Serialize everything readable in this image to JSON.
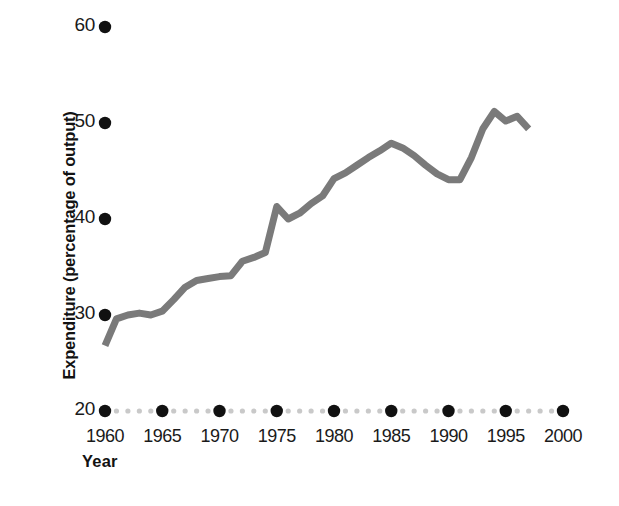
{
  "chart_data": {
    "type": "line",
    "title": "",
    "xlabel": "Year",
    "ylabel": "Expenditure (percentage of output)",
    "xlim": [
      1958,
      2001
    ],
    "ylim": [
      20,
      62
    ],
    "grid": false,
    "legend": null,
    "xticks": [
      "1960",
      "1965",
      "1970",
      "1975",
      "1980",
      "1985",
      "1990",
      "1995",
      "2000"
    ],
    "xtick_values": [
      1960,
      1965,
      1970,
      1975,
      1980,
      1985,
      1990,
      1995,
      2000
    ],
    "yticks": [
      "20",
      "30",
      "40",
      "50",
      "60"
    ],
    "ytick_values": [
      20,
      30,
      40,
      50,
      60
    ],
    "series": [
      {
        "name": "Expenditure",
        "color": "#7a7a7a",
        "linewidth": 7,
        "x": [
          1960,
          1961,
          1962,
          1963,
          1964,
          1965,
          1966,
          1967,
          1968,
          1969,
          1970,
          1971,
          1972,
          1973,
          1974,
          1975,
          1976,
          1977,
          1978,
          1979,
          1980,
          1981,
          1982,
          1983,
          1984,
          1985,
          1986,
          1987,
          1988,
          1989,
          1990,
          1991,
          1992,
          1993,
          1994,
          1995,
          1996,
          1997
        ],
        "y": [
          26.8,
          29.6,
          30.0,
          30.2,
          30.0,
          30.4,
          31.6,
          32.9,
          33.6,
          33.8,
          34.0,
          34.1,
          35.6,
          36.0,
          36.5,
          41.3,
          40.0,
          40.6,
          41.6,
          42.4,
          44.2,
          44.8,
          45.6,
          46.4,
          47.1,
          47.9,
          47.4,
          46.6,
          45.6,
          44.7,
          44.1,
          44.1,
          46.4,
          49.4,
          51.2,
          50.2,
          50.7,
          49.4
        ]
      }
    ],
    "axis_style": {
      "x_axis_marker_color_major": "#111111",
      "x_axis_marker_color_minor": "#c9c9c9",
      "y_axis_marker_color": "#111111",
      "note": "axes drawn as dotted marker rows; large dark dots at major ticks, small light dots between"
    }
  }
}
